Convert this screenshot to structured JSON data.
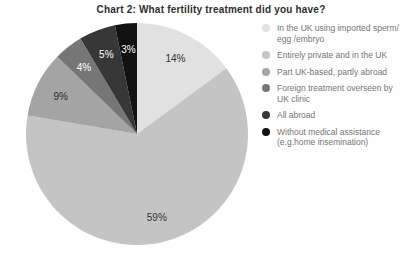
{
  "chart_data": {
    "type": "pie",
    "title": "Chart 2: What fertility treatment did you have?",
    "categories": [
      "In the UK using imported sperm/ egg /embryo",
      "Entirely private and in the UK",
      "Part UK-based, partly abroad",
      "Foreign treatment overseen by UK clinic",
      "All abroad",
      "Without medical assistance (e.g.home insemination)"
    ],
    "values": [
      14,
      59,
      9,
      4,
      5,
      3
    ],
    "slice_labels": [
      "14%",
      "59%",
      "9%",
      "4%",
      "5%",
      "3%"
    ],
    "unit": "%",
    "colors": [
      "#e1e1e1",
      "#c4c4c4",
      "#a4a4a4",
      "#767676",
      "#373737",
      "#111111"
    ],
    "label_text_colors": [
      "#333333",
      "#333333",
      "#2b2b2b",
      "#ffffff",
      "#ffffff",
      "#ffffff"
    ],
    "legend_position": "right",
    "legend_text_color": "#757575",
    "start_angle": "top",
    "direction": "clockwise"
  }
}
